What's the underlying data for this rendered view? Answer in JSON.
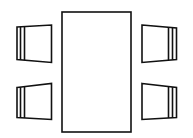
{
  "diagram": {
    "type": "floor-plan",
    "stroke_color": "#111111",
    "background": "#ffffff",
    "table": {
      "shape": "rectangle"
    },
    "chairs": [
      {
        "position": "top-left",
        "facing": "right"
      },
      {
        "position": "bottom-left",
        "facing": "right"
      },
      {
        "position": "top-right",
        "facing": "left"
      },
      {
        "position": "bottom-right",
        "facing": "left"
      }
    ]
  }
}
